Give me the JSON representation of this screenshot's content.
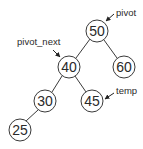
{
  "diagram": {
    "nodes": [
      {
        "id": "n50",
        "value": "50"
      },
      {
        "id": "n40",
        "value": "40"
      },
      {
        "id": "n60",
        "value": "60"
      },
      {
        "id": "n30",
        "value": "30"
      },
      {
        "id": "n45",
        "value": "45"
      },
      {
        "id": "n25",
        "value": "25"
      }
    ],
    "edges": [
      {
        "from": "50",
        "to": "40"
      },
      {
        "from": "50",
        "to": "60"
      },
      {
        "from": "40",
        "to": "30"
      },
      {
        "from": "40",
        "to": "45"
      },
      {
        "from": "30",
        "to": "25"
      }
    ],
    "labels": {
      "pivot": "pivot",
      "pivot_next": "pivot_next",
      "temp": "temp"
    },
    "colors": {
      "stroke": "#3a3a3a",
      "text": "#2a2a2a",
      "background": "#ffffff"
    }
  }
}
